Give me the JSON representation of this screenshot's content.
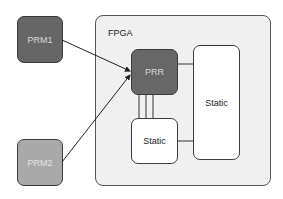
{
  "diagram": {
    "container": {
      "label": "FPGA",
      "fill": "#f0f0f0"
    },
    "nodes": {
      "prm1": {
        "label": "PRM1",
        "fill": "#666666"
      },
      "prm2": {
        "label": "PRM2",
        "fill": "#a9a9a9"
      },
      "prr": {
        "label": "PRR",
        "fill": "#676767"
      },
      "static_tall": {
        "label": "Static",
        "fill": "#ffffff"
      },
      "static_small": {
        "label": "Static",
        "fill": "#ffffff"
      }
    },
    "edges": [
      {
        "from": "PRM1",
        "to": "PRR",
        "type": "arrow"
      },
      {
        "from": "PRM2",
        "to": "PRR",
        "type": "arrow"
      },
      {
        "from": "PRR",
        "to": "Static (tall)",
        "type": "line"
      },
      {
        "from": "PRR",
        "to": "Static (small)",
        "type": "triple-line"
      },
      {
        "from": "Static (small)",
        "to": "Static (tall)",
        "type": "line"
      }
    ]
  }
}
